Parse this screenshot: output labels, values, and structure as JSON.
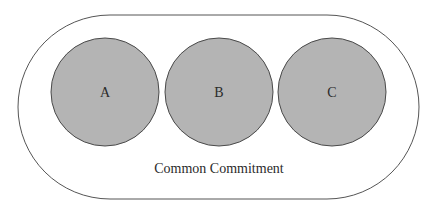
{
  "diagram": {
    "outer": {
      "label": "Common Commitment",
      "stroke": "#555555",
      "fill": "#ffffff"
    },
    "circles": [
      {
        "label": "A",
        "cx": 105,
        "cy": 92,
        "r": 54
      },
      {
        "label": "B",
        "cx": 219,
        "cy": 92,
        "r": 54
      },
      {
        "label": "C",
        "cx": 332,
        "cy": 92,
        "r": 54
      }
    ],
    "circle_fill": "#b4b4b4",
    "circle_stroke": "#4a4a4a"
  }
}
